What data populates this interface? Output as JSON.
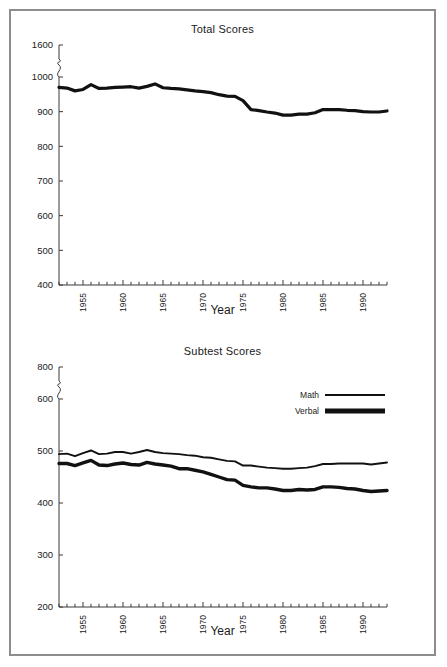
{
  "figure": {
    "panels": [
      {
        "id": "total-scores",
        "title": "Total Scores",
        "xlabel": "Year",
        "ylabel": ""
      },
      {
        "id": "subtest-scores",
        "title": "Subtest Scores",
        "xlabel": "Year",
        "ylabel": ""
      }
    ],
    "legend": {
      "entries": [
        {
          "label": "Math",
          "style": "thin"
        },
        {
          "label": "Verbal",
          "style": "thick"
        }
      ]
    }
  },
  "chart_data": [
    {
      "type": "line",
      "title": "Total Scores",
      "xlabel": "Year",
      "ylabel": "",
      "grid": false,
      "legend_position": "none",
      "axis_break": {
        "axis": "y",
        "between": [
          1000,
          1600
        ]
      },
      "yticks": [
        400,
        500,
        600,
        700,
        800,
        900,
        1000,
        1600
      ],
      "ytick_labels": [
        "400",
        "500",
        "600",
        "700",
        "800",
        "900",
        "1000",
        "1600"
      ],
      "ylim": [
        400,
        1000
      ],
      "xticks": [
        1955,
        1960,
        1965,
        1970,
        1975,
        1980,
        1985,
        1990
      ],
      "xtick_labels": [
        "1955",
        "1960",
        "1965",
        "1970",
        "1975",
        "1980",
        "1985",
        "1990"
      ],
      "xlim": [
        1952,
        1993
      ],
      "x": [
        1952,
        1953,
        1954,
        1955,
        1956,
        1957,
        1958,
        1959,
        1960,
        1961,
        1962,
        1963,
        1964,
        1965,
        1966,
        1967,
        1968,
        1969,
        1970,
        1971,
        1972,
        1973,
        1974,
        1975,
        1976,
        1977,
        1978,
        1979,
        1980,
        1981,
        1982,
        1983,
        1984,
        1985,
        1986,
        1987,
        1988,
        1989,
        1990,
        1991,
        1992,
        1993
      ],
      "series": [
        {
          "name": "Total",
          "values": [
            970,
            968,
            960,
            964,
            978,
            967,
            968,
            970,
            971,
            972,
            968,
            973,
            980,
            969,
            967,
            966,
            963,
            960,
            958,
            955,
            949,
            945,
            944,
            932,
            906,
            903,
            899,
            896,
            890,
            890,
            893,
            893,
            897,
            906,
            906,
            906,
            904,
            903,
            900,
            899,
            899,
            902
          ]
        }
      ]
    },
    {
      "type": "line",
      "title": "Subtest Scores",
      "xlabel": "Year",
      "ylabel": "",
      "grid": false,
      "legend_position": "upper right",
      "axis_break": {
        "axis": "y",
        "between": [
          600,
          800
        ]
      },
      "yticks": [
        200,
        300,
        400,
        500,
        600,
        800
      ],
      "ytick_labels": [
        "200",
        "300",
        "400",
        "500",
        "600",
        "800"
      ],
      "ylim": [
        200,
        600
      ],
      "xticks": [
        1955,
        1960,
        1965,
        1970,
        1975,
        1980,
        1985,
        1990
      ],
      "xtick_labels": [
        "1955",
        "1960",
        "1965",
        "1970",
        "1975",
        "1980",
        "1985",
        "1990"
      ],
      "xlim": [
        1952,
        1993
      ],
      "x": [
        1952,
        1953,
        1954,
        1955,
        1956,
        1957,
        1958,
        1959,
        1960,
        1961,
        1962,
        1963,
        1964,
        1965,
        1966,
        1967,
        1968,
        1969,
        1970,
        1971,
        1972,
        1973,
        1974,
        1975,
        1976,
        1977,
        1978,
        1979,
        1980,
        1981,
        1982,
        1983,
        1984,
        1985,
        1986,
        1987,
        1988,
        1989,
        1990,
        1991,
        1992,
        1993
      ],
      "series": [
        {
          "name": "Math",
          "values": [
            494,
            495,
            490,
            496,
            501,
            494,
            495,
            498,
            498,
            495,
            498,
            502,
            498,
            496,
            495,
            494,
            492,
            491,
            488,
            487,
            484,
            481,
            480,
            472,
            472,
            470,
            468,
            467,
            466,
            466,
            467,
            468,
            471,
            475,
            475,
            476,
            476,
            476,
            476,
            474,
            476,
            478
          ]
        },
        {
          "name": "Verbal",
          "values": [
            476,
            476,
            472,
            477,
            482,
            473,
            472,
            475,
            477,
            474,
            473,
            478,
            475,
            473,
            471,
            466,
            466,
            463,
            460,
            455,
            450,
            445,
            444,
            434,
            431,
            429,
            429,
            427,
            424,
            424,
            426,
            425,
            426,
            431,
            431,
            430,
            428,
            427,
            424,
            422,
            423,
            424
          ]
        }
      ]
    }
  ]
}
